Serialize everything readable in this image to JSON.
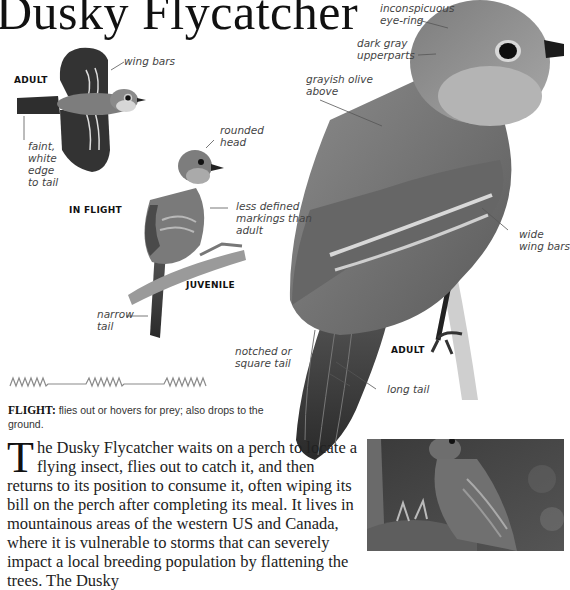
{
  "page": {
    "title": "Dusky Flycatcher"
  },
  "illustrations": {
    "flight": {
      "caption": "IN FLIGHT",
      "age_label": "ADULT",
      "annotations": [
        "wing bars",
        "faint, white edge to tail"
      ]
    },
    "juvenile": {
      "caption": "JUVENILE",
      "annotations": [
        "rounded head",
        "less defined markings than adult",
        "narrow tail"
      ]
    },
    "adult": {
      "caption": "ADULT",
      "annotations": [
        "inconspicuous eye-ring",
        "dark gray upperparts",
        "grayish olive above",
        "wide wing bars",
        "notched or square tail",
        "long tail"
      ]
    }
  },
  "labels": {
    "wing_bars": "wing bars",
    "faint_1": "faint,",
    "faint_2": "white",
    "faint_3": "edge",
    "faint_4": "to tail",
    "rounded_1": "rounded",
    "rounded_2": "head",
    "less_1": "less defined",
    "less_2": "markings than",
    "less_3": "adult",
    "narrow_1": "narrow",
    "narrow_2": "tail",
    "eyering_1": "inconspicuous",
    "eyering_2": "eye-ring",
    "darkgray_1": "dark gray",
    "darkgray_2": "upperparts",
    "olive_1": "grayish olive",
    "olive_2": "above",
    "wide_1": "wide",
    "wide_2": "wing bars",
    "notched_1": "notched or",
    "notched_2": "square tail",
    "long_tail": "long tail"
  },
  "flight_pattern": {
    "label": "FLIGHT:",
    "description": "flies out or hovers for prey; also drops to the ground."
  },
  "description": {
    "drop_cap": "T",
    "text": "he Dusky Flycatcher waits on a perch to locate a flying insect, flies out to catch it, and then returns to its position to consume it, often wiping its bill on the perch after completing its meal. It lives in mountainous areas of the western US and Canada, where it is vulnerable to storms that can severely impact a local breeding population by flattening the trees. The Dusky"
  },
  "photo": {
    "subject": "adult feeding nestlings"
  }
}
